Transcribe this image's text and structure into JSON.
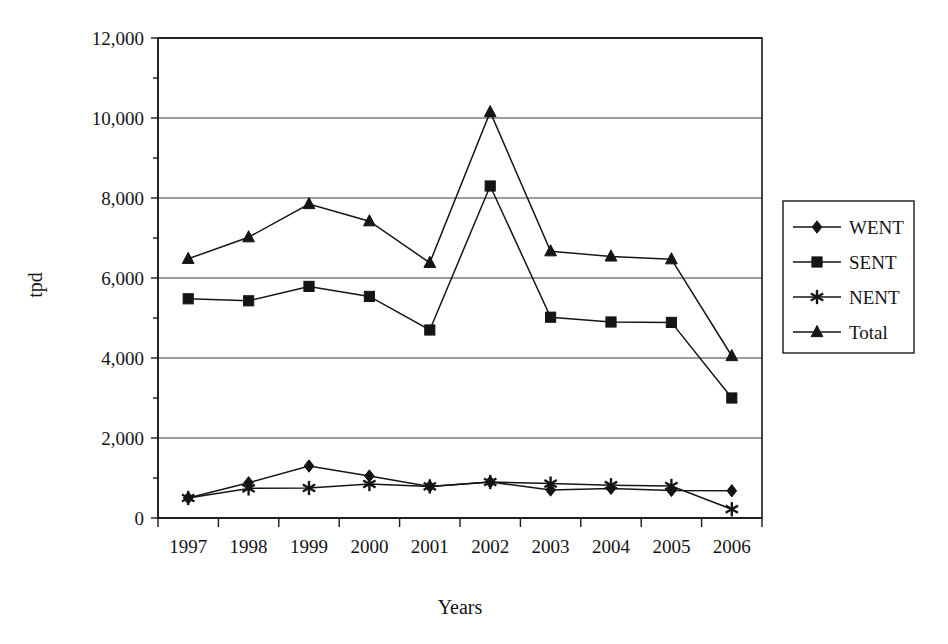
{
  "chart_data": {
    "type": "line",
    "title": "",
    "xlabel": "Years",
    "ylabel": "tpd",
    "categories": [
      "1997",
      "1998",
      "1999",
      "2000",
      "2001",
      "2002",
      "2003",
      "2004",
      "2005",
      "2006"
    ],
    "ylim": [
      0,
      12000
    ],
    "ytick_values": [
      0,
      2000,
      4000,
      6000,
      8000,
      10000,
      12000
    ],
    "ytick_labels": [
      "0",
      "2,000",
      "4,000",
      "6,000",
      "8,000",
      "10,000",
      "12,000"
    ],
    "grid": "horizontal",
    "legend_position": "right-outside",
    "series": [
      {
        "name": "WENT",
        "marker": "diamond",
        "values": [
          500,
          880,
          1300,
          1050,
          790,
          900,
          700,
          740,
          690,
          680
        ]
      },
      {
        "name": "SENT",
        "marker": "square",
        "values": [
          5480,
          5430,
          5790,
          5540,
          4700,
          8300,
          5020,
          4900,
          4890,
          3000
        ]
      },
      {
        "name": "NENT",
        "marker": "star",
        "values": [
          500,
          740,
          750,
          850,
          790,
          900,
          860,
          820,
          800,
          220
        ]
      },
      {
        "name": "Total",
        "marker": "triangle",
        "values": [
          6480,
          7020,
          7850,
          7420,
          6380,
          10150,
          6670,
          6540,
          6470,
          4050
        ]
      }
    ]
  },
  "colors": {
    "line": "#151515",
    "grid": "#3b3b3b",
    "axis": "#1a1a1a",
    "background": "#ffffff"
  },
  "legend": {
    "items": [
      {
        "label": "WENT",
        "marker": "diamond"
      },
      {
        "label": "SENT",
        "marker": "square"
      },
      {
        "label": "NENT",
        "marker": "star"
      },
      {
        "label": "Total",
        "marker": "triangle"
      }
    ]
  }
}
